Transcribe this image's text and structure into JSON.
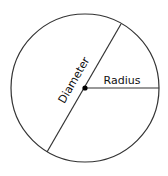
{
  "diagram": {
    "type": "circle-anatomy",
    "labels": {
      "diameter": "Diameter",
      "radius": "Radius"
    },
    "geometry": {
      "center": [
        85,
        88
      ],
      "radius": 74,
      "diameter_endpoints": [
        [
          121,
          24
        ],
        [
          47,
          152
        ]
      ],
      "radius_endpoint": [
        159,
        88
      ]
    },
    "colors": {
      "stroke": "#333333",
      "center_dot": "#000000",
      "background": "#ffffff"
    }
  }
}
